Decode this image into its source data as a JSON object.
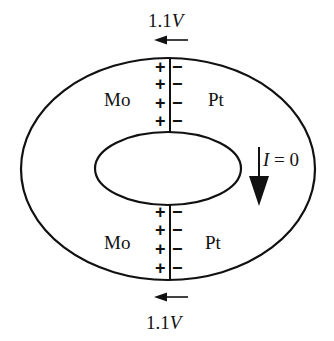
{
  "diagram": {
    "top_voltage": {
      "value": "1.1",
      "unit": "V"
    },
    "bottom_voltage": {
      "value": "1.1",
      "unit": "V"
    },
    "top_left_metal": "Mo",
    "top_right_metal": "Pt",
    "bottom_left_metal": "Mo",
    "bottom_right_metal": "Pt",
    "current_label": {
      "symbol": "I",
      "eq": " = 0"
    },
    "junction_signs": {
      "left": "+",
      "right": "−",
      "count_per_junction": 4
    },
    "arrows": [
      "voltage-arrow-left-top",
      "voltage-arrow-left-bottom",
      "current-arrow-down"
    ]
  }
}
